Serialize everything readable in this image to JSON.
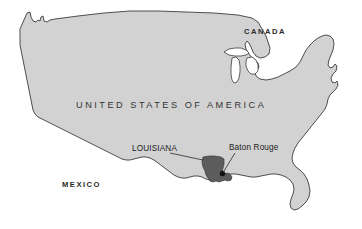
{
  "map": {
    "title": "Map of the United States of America highlighting Louisiana and Baton Rouge",
    "background_color": "#ffffff",
    "land_fill": "#d2d2d2",
    "land_stroke": "#3c3c3c",
    "lake_fill": "#ffffff",
    "highlight_fill": "#5c5c5c",
    "city_dot_color": "#111111",
    "leader_line_color": "#333333",
    "labels": {
      "canada": "CANADA",
      "united_states": "UNITED STATES OF AMERICA",
      "mexico": "MEXICO",
      "louisiana": "LOUISIANA",
      "baton_rouge": "Baton Rouge"
    },
    "highlighted_state": "LOUISIANA",
    "marked_city": "Baton Rouge"
  }
}
